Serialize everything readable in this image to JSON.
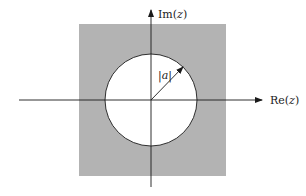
{
  "diagram": {
    "type": "complex-plane-region",
    "axes": {
      "x_label_prefix": "Re(",
      "x_label_var": "z",
      "x_label_suffix": ")",
      "y_label_prefix": "Im(",
      "y_label_var": "z",
      "y_label_suffix": ")"
    },
    "radius_label_left": "|",
    "radius_label_var": "a",
    "radius_label_right": "|",
    "colors": {
      "shaded_region": "#b3b3b3",
      "circle_fill": "#ffffff",
      "lines": "#1a1a1a",
      "background": "#ffffff"
    }
  }
}
